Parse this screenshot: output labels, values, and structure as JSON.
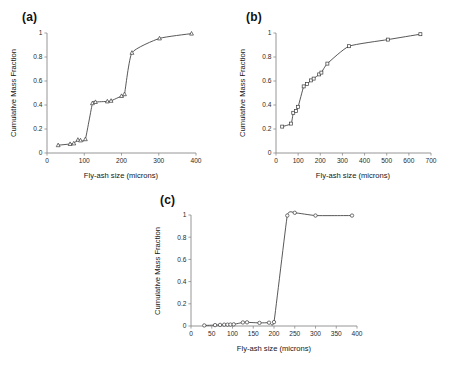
{
  "figure": {
    "panel_a_label": "(a)",
    "panel_b_label": "(b)",
    "panel_c_label": "(c)"
  },
  "chart_data": [
    {
      "type": "line",
      "panel": "(a)",
      "title": "",
      "xlabel": "Fly-ash size (microns)",
      "ylabel": "Cumulative Mass Fraction",
      "xlim": [
        0,
        400
      ],
      "ylim": [
        0,
        1
      ],
      "xticks": [
        0,
        100,
        200,
        300,
        400
      ],
      "yticks": [
        0,
        0.2,
        0.4,
        0.6,
        0.8,
        1
      ],
      "grid": false,
      "legend": "none",
      "marker": "open-triangle",
      "x": [
        30,
        62,
        72,
        83,
        90,
        103,
        122,
        130,
        162,
        172,
        200,
        208,
        228,
        302,
        388
      ],
      "y": [
        0.065,
        0.075,
        0.08,
        0.11,
        0.105,
        0.115,
        0.415,
        0.425,
        0.43,
        0.435,
        0.475,
        0.49,
        0.835,
        0.955,
        0.995
      ]
    },
    {
      "type": "line",
      "panel": "(b)",
      "title": "",
      "xlabel": "Fly-ash size (microns)",
      "ylabel": "Cumulative Mass Fraction",
      "xlim": [
        0,
        700
      ],
      "ylim": [
        0,
        1
      ],
      "xticks": [
        0,
        100,
        200,
        300,
        400,
        500,
        600,
        700
      ],
      "yticks": [
        0,
        0.2,
        0.4,
        0.6,
        0.8,
        1
      ],
      "grid": false,
      "legend": "none",
      "marker": "open-square",
      "x": [
        28,
        68,
        78,
        90,
        100,
        125,
        140,
        158,
        170,
        195,
        205,
        232,
        330,
        505,
        652
      ],
      "y": [
        0.22,
        0.245,
        0.335,
        0.35,
        0.385,
        0.555,
        0.575,
        0.605,
        0.62,
        0.655,
        0.67,
        0.745,
        0.89,
        0.945,
        0.99
      ]
    },
    {
      "type": "line",
      "panel": "(c)",
      "title": "",
      "xlabel": "Fly-ash size (microns)",
      "ylabel": "Cumulative Mass Fraction",
      "xlim": [
        0,
        400
      ],
      "ylim": [
        0,
        1
      ],
      "xticks": [
        0,
        50,
        100,
        150,
        200,
        250,
        300,
        350,
        400
      ],
      "yticks": [
        0,
        0.2,
        0.4,
        0.6,
        0.8,
        1
      ],
      "grid": false,
      "legend": "none",
      "marker": "open-circle",
      "x": [
        32,
        58,
        70,
        80,
        88,
        95,
        103,
        125,
        135,
        165,
        188,
        200,
        232,
        250,
        300,
        388
      ],
      "y": [
        0.005,
        0.008,
        0.01,
        0.012,
        0.012,
        0.013,
        0.015,
        0.032,
        0.033,
        0.028,
        0.03,
        0.035,
        0.995,
        1.02,
        0.995,
        0.995
      ]
    }
  ]
}
